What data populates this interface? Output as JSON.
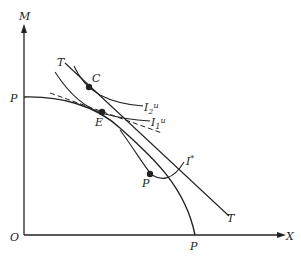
{
  "diagram": {
    "type": "economics-ppf-indifference",
    "axes": {
      "y_label": "M",
      "x_label": "X",
      "origin_label": "O"
    },
    "curves": {
      "ppf_label_y": "P",
      "ppf_label_x": "P",
      "tangent_line_top_label": "T",
      "tangent_line_bottom_label": "T",
      "indifference_2": {
        "base": "I",
        "sub": "2",
        "sup": "u"
      },
      "indifference_1": {
        "base": "I",
        "sub": "1",
        "sup": "u"
      },
      "indifference_star": {
        "base": "I",
        "sup": "*"
      }
    },
    "points": {
      "c": "C",
      "e": "E",
      "p": "P"
    },
    "colors": {
      "line": "#222222",
      "background": "#ffffff"
    }
  }
}
